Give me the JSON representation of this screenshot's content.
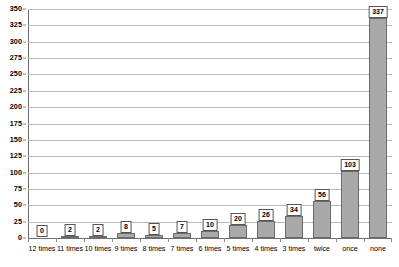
{
  "chart_data": {
    "type": "bar",
    "title": "",
    "subtitle": "",
    "xlabel": "",
    "ylabel": "",
    "ylim": [
      0,
      350
    ],
    "ytick_step": 25,
    "yticks": [
      350,
      325,
      300,
      275,
      250,
      225,
      200,
      175,
      150,
      125,
      100,
      75,
      50,
      25,
      0
    ],
    "grid": true,
    "legend": "none",
    "categories": [
      "12 times",
      "11 times",
      "10 times",
      "9 times",
      "8 times",
      "7 times",
      "6 times",
      "5 times",
      "4 times",
      "3 times",
      "twice",
      "once",
      "none"
    ],
    "values": [
      0,
      2,
      2,
      8,
      5,
      7,
      10,
      20,
      26,
      34,
      56,
      103,
      337
    ],
    "data_labels": [
      "0",
      "2",
      "2",
      "8",
      "5",
      "7",
      "10",
      "20",
      "26",
      "34",
      "56",
      "103",
      "337"
    ],
    "colors": {
      "bar_fill": "#a9a9a9",
      "bar_border": "#6b6b6b",
      "gridline": "#b9b9b9",
      "axis": "#6e6e6e",
      "label_box_bg": "#ffffff",
      "label_box_border": "#555555",
      "text": "#000000",
      "background": "#ffffff"
    }
  }
}
